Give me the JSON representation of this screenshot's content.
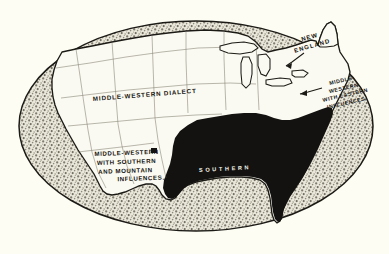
{
  "figure": {
    "title": "AMERICAN DIALECTS",
    "kind": "map",
    "medium": "halftone print on cream paper",
    "background_color": "#fdfdf3",
    "ink_color": "#14120e",
    "stipple_color": "#9a968a",
    "frame_shape": "ellipse"
  },
  "legend_colors": {
    "southern_fill": "#141210",
    "surround_stipple": "#a5a195",
    "land_fill": "#fbfaf2",
    "outline": "#1c1a15",
    "title_ink": "#d8d6c4"
  },
  "regions": [
    {
      "id": "middle-western-dialect",
      "label": "MIDDLE-WESTERN DIALECT",
      "lines": [
        "MIDDLE-WESTERN DIALECT"
      ],
      "fill": "white",
      "position": "north-central"
    },
    {
      "id": "new-england",
      "label": "NEW ENGLAND",
      "lines": [
        "NEW",
        "ENGLAND"
      ],
      "fill": "stipple",
      "position": "northeast"
    },
    {
      "id": "middle-western-with-eastern-influences",
      "label": "MIDDLE-WESTERN WITH EASTERN INFLUENCES",
      "lines": [
        "MIDDLE-",
        "WESTERN",
        "WITH EASTERN",
        "INFLUENCES."
      ],
      "fill": "stipple",
      "position": "east"
    },
    {
      "id": "middle-western-with-southern-and-mountain-influences",
      "label": "MIDDLE-WESTERN WITH SOUTHERN AND MOUNTAIN INFLUENCES.",
      "lines": [
        "MIDDLE-WESTERN",
        "WITH SOUTHERN",
        "AND MOUNTAIN",
        "INFLUENCES."
      ],
      "fill": "white",
      "position": "south-central-west"
    },
    {
      "id": "southern",
      "label": "SOUTHERN",
      "lines": [
        "SOUTHERN"
      ],
      "fill": "black",
      "position": "southeast"
    }
  ]
}
